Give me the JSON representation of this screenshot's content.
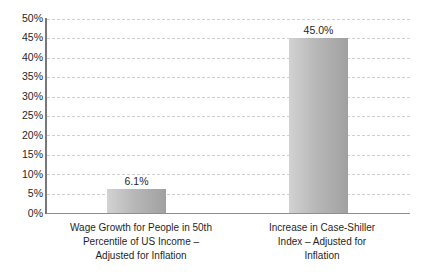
{
  "chart_data": {
    "type": "bar",
    "title": "",
    "subtitle": "",
    "xlabel": "",
    "ylabel": "",
    "categories": [
      "Wage Growth for People in 50th Percentile of US Income – Adjusted for Inflation",
      "Increase in Case-Shiller Index – Adjusted for Inflation"
    ],
    "category_lines": [
      [
        "Wage Growth for People in 50th",
        "Percentile of US Income –",
        "Adjusted for Inflation"
      ],
      [
        "Increase in Case-Shiller",
        "Index – Adjusted for",
        "Inflation"
      ]
    ],
    "values": [
      6.1,
      45.0
    ],
    "data_labels": [
      "6.1%",
      "45.0%"
    ],
    "ylim": [
      0,
      50
    ],
    "ytick_values": [
      0,
      5,
      10,
      15,
      20,
      25,
      30,
      35,
      40,
      45,
      50
    ],
    "ytick_labels": [
      "0%",
      "5%",
      "10%",
      "15%",
      "20%",
      "25%",
      "30%",
      "35%",
      "40%",
      "45%",
      "50%"
    ],
    "grid": true,
    "grid_style": "dashed",
    "legend": false,
    "legend_position": "none",
    "bar_fill_light": "#d2d2d2",
    "bar_fill_dark": "#a0a0a0",
    "gridline_color": "#cfcfd4",
    "axis_color": "#77777c",
    "background_color": "#ffffff",
    "text_color": "#1f1f1f"
  }
}
